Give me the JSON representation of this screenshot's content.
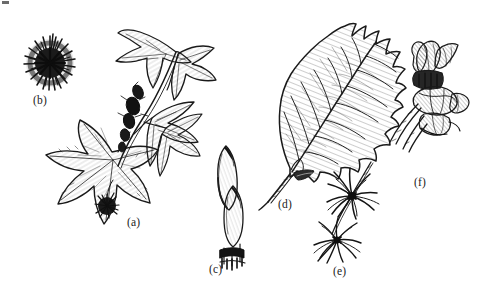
{
  "figure": {
    "kind": "botanical-line-illustration",
    "background_color": "#ffffff",
    "ink_color": "#1a1a1a",
    "width": 477,
    "height": 297,
    "panel_count": 6
  },
  "labels": {
    "a": "(a)",
    "b": "(b)",
    "c": "(c)",
    "d": "(d)",
    "e": "(e)",
    "f": "(f)"
  },
  "panels": [
    {
      "key": "a",
      "label": "(a)",
      "subject": "leafy branch with star-shaped palmately-lobed leaves and dark flower cluster",
      "label_x": 127,
      "label_y": 216
    },
    {
      "key": "b",
      "label": "(b)",
      "subject": "spiny spherical fruit head",
      "label_x": 33,
      "label_y": 94
    },
    {
      "key": "c",
      "label": "(c)",
      "subject": "twig with two elongated pointed winter buds",
      "label_x": 209,
      "label_y": 263
    },
    {
      "key": "d",
      "label": "(d)",
      "subject": "broad oval leaf with wavy margin, pinnate veins and asymmetric base on a petiole",
      "label_x": 278,
      "label_y": 198
    },
    {
      "key": "e",
      "label": "(e)",
      "subject": "two clusters of narrow strap-shaped ribbon petals on a slender twig",
      "label_x": 333,
      "label_y": 265
    },
    {
      "key": "f",
      "label": "(f)",
      "subject": "woody seed capsules and bud scales on a short shoot",
      "label_x": 414,
      "label_y": 176
    }
  ]
}
